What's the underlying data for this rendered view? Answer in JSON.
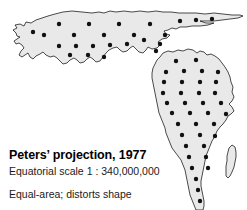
{
  "figure": {
    "kind": "map-projection-illustration",
    "background_color": "#ffffff",
    "land_fill_color": "#e9e9e9",
    "land_outline_color": "#000000",
    "indicator_dot_color": "#111111"
  },
  "caption": {
    "title": "Peters’ projection, 1977",
    "scale": "Equatorial scale 1 : 340,000,000",
    "note": "Equal-area; distorts shape"
  },
  "landmasses": [
    {
      "name": "eurasia",
      "label": "Eurasia"
    },
    {
      "name": "africa",
      "label": "Africa"
    },
    {
      "name": "madagascar",
      "label": "Madagascar"
    }
  ],
  "distortion_indicators": {
    "symbol": "circle",
    "radius_px": 2.2,
    "eurasia_points": [
      [
        44,
        35
      ],
      [
        59,
        24
      ],
      [
        74,
        35
      ],
      [
        89,
        24
      ],
      [
        104,
        35
      ],
      [
        119,
        24
      ],
      [
        134,
        35
      ],
      [
        150,
        24
      ],
      [
        165,
        35
      ],
      [
        180,
        21
      ],
      [
        196,
        20
      ],
      [
        212,
        19
      ],
      [
        59,
        46
      ],
      [
        76,
        46
      ],
      [
        93,
        46
      ],
      [
        110,
        45
      ],
      [
        127,
        44
      ],
      [
        144,
        40
      ],
      [
        160,
        44
      ],
      [
        70,
        55
      ],
      [
        88,
        55
      ],
      [
        104,
        57
      ],
      [
        156,
        51
      ],
      [
        33,
        32
      ]
    ],
    "africa_points": [
      [
        176,
        61
      ],
      [
        196,
        60
      ],
      [
        166,
        72
      ],
      [
        184,
        71
      ],
      [
        202,
        71
      ],
      [
        218,
        72
      ],
      [
        164,
        82
      ],
      [
        182,
        82
      ],
      [
        200,
        82
      ],
      [
        216,
        82
      ],
      [
        163,
        93
      ],
      [
        181,
        93
      ],
      [
        199,
        93
      ],
      [
        215,
        93
      ],
      [
        167,
        103
      ],
      [
        185,
        103
      ],
      [
        203,
        103
      ],
      [
        221,
        103
      ],
      [
        172,
        113
      ],
      [
        190,
        113
      ],
      [
        208,
        113
      ],
      [
        226,
        114
      ],
      [
        178,
        124
      ],
      [
        196,
        124
      ],
      [
        214,
        124
      ],
      [
        182,
        135
      ],
      [
        200,
        135
      ],
      [
        215,
        136
      ],
      [
        186,
        146
      ],
      [
        204,
        146
      ],
      [
        189,
        157
      ],
      [
        206,
        157
      ],
      [
        192,
        168
      ],
      [
        208,
        168
      ],
      [
        196,
        179
      ],
      [
        198,
        190
      ],
      [
        200,
        201
      ]
    ]
  }
}
